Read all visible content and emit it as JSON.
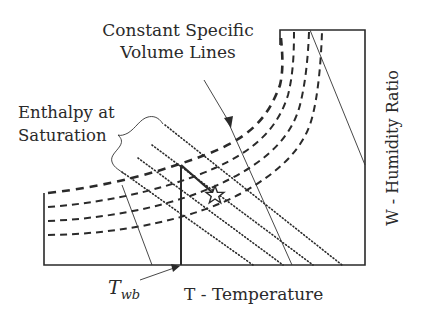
{
  "diagram": {
    "type": "psychrometric-chart-schematic",
    "labels": {
      "volume_title_line1": "Constant Specific",
      "volume_title_line2": "Volume Lines",
      "enthalpy_line1": "Enthalpy at",
      "enthalpy_line2": "Saturation",
      "x_axis": "T - Temperature",
      "y_axis": "W - Humidity Ratio",
      "twb_main": "T",
      "twb_sub": "wb"
    },
    "elements": {
      "saturation_curves": 4,
      "enthalpy_lines": 4,
      "specific_volume_lines": 3,
      "state_point_marker": "star"
    },
    "colors": {
      "ink": "#2a2a2a",
      "background": "#ffffff"
    }
  }
}
